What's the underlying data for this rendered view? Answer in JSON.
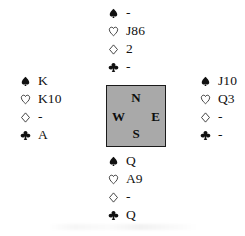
{
  "diagram": {
    "type": "bridge-deal",
    "suit_order": [
      "spades",
      "hearts",
      "diamonds",
      "clubs"
    ],
    "suit_symbols": {
      "spades": "spade-pip",
      "hearts": "heart-pip",
      "diamonds": "diamond-pip",
      "clubs": "club-pip"
    },
    "colors": {
      "ink": "#111111",
      "compass_fill": "#a9a9a9",
      "compass_border": "#1a1a1a",
      "background": "#ffffff"
    }
  },
  "compass": {
    "north": "N",
    "west": "W",
    "east": "E",
    "south": "S"
  },
  "hands": {
    "north": {
      "position": "North",
      "spades": "-",
      "hearts": "J86",
      "diamonds": "2",
      "clubs": "-"
    },
    "west": {
      "position": "West",
      "spades": "K",
      "hearts": "K10",
      "diamonds": "-",
      "clubs": "A"
    },
    "east": {
      "position": "East",
      "spades": "J10",
      "hearts": "Q3",
      "diamonds": "-",
      "clubs": "-"
    },
    "south": {
      "position": "South",
      "spades": "Q",
      "hearts": "A9",
      "diamonds": "-",
      "clubs": "Q"
    }
  }
}
